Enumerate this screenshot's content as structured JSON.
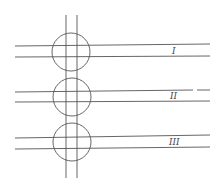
{
  "diagram": {
    "vertical_strip": {
      "x1": 66,
      "x2": 77,
      "y_top": 15,
      "y_bottom": 178
    },
    "crossings": [
      {
        "label": "I",
        "circle": {
          "cx": 71,
          "cy": 52,
          "r": 19
        },
        "lines": {
          "y_top": 45,
          "y_bottom": 57,
          "x_start": 15,
          "x_end": 210
        },
        "label_x": 172,
        "label_y": 54
      },
      {
        "label": "II",
        "circle": {
          "cx": 72,
          "cy": 97,
          "r": 19
        },
        "lines": {
          "y_top": 91,
          "y_bottom": 101,
          "x_start": 15,
          "x_end": 210
        },
        "label_x": 170,
        "label_y": 99
      },
      {
        "label": "III",
        "circle": {
          "cx": 72,
          "cy": 142,
          "r": 19
        },
        "lines": {
          "y_top": 136,
          "y_bottom": 148,
          "x_start": 15,
          "x_end": 210
        },
        "label_x": 169,
        "label_y": 145
      }
    ],
    "line_color": "#555555"
  }
}
